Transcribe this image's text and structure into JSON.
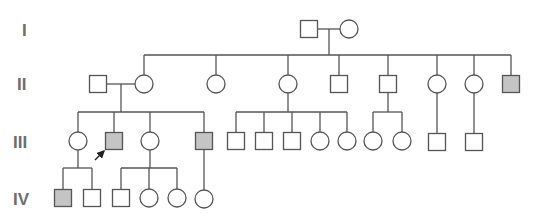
{
  "colors": {
    "line": "#555555",
    "unaffected_fill": "#ffffff",
    "affected_fill": "#c4c4c4",
    "label": "#6e6e6e"
  },
  "generations": [
    {
      "label": "I",
      "x": 22,
      "y": 36
    },
    {
      "label": "II",
      "x": 17,
      "y": 90
    },
    {
      "label": "III",
      "x": 13,
      "y": 148
    },
    {
      "label": "IV",
      "x": 13,
      "y": 205
    }
  ],
  "shape_size": 17,
  "individuals": [
    {
      "id": "I-1",
      "sex": "male",
      "affected": false,
      "x": 309,
      "y": 29
    },
    {
      "id": "I-2",
      "sex": "female",
      "affected": false,
      "x": 349,
      "y": 29
    },
    {
      "id": "II-spouse",
      "sex": "male",
      "affected": false,
      "x": 98,
      "y": 84
    },
    {
      "id": "II-1",
      "sex": "female",
      "affected": false,
      "x": 144,
      "y": 84
    },
    {
      "id": "II-2",
      "sex": "female",
      "affected": false,
      "x": 216,
      "y": 84
    },
    {
      "id": "II-3",
      "sex": "female",
      "affected": false,
      "x": 288,
      "y": 84
    },
    {
      "id": "II-4",
      "sex": "male",
      "affected": false,
      "x": 339,
      "y": 84
    },
    {
      "id": "II-5",
      "sex": "male",
      "affected": false,
      "x": 388,
      "y": 84
    },
    {
      "id": "II-6",
      "sex": "female",
      "affected": false,
      "x": 437,
      "y": 84
    },
    {
      "id": "II-7",
      "sex": "female",
      "affected": false,
      "x": 474,
      "y": 84
    },
    {
      "id": "II-8",
      "sex": "male",
      "affected": true,
      "x": 511,
      "y": 84
    },
    {
      "id": "III-1",
      "sex": "female",
      "affected": false,
      "x": 78,
      "y": 141
    },
    {
      "id": "III-2",
      "sex": "male",
      "affected": true,
      "proband": true,
      "x": 114,
      "y": 141
    },
    {
      "id": "III-3",
      "sex": "female",
      "affected": false,
      "x": 150,
      "y": 141
    },
    {
      "id": "III-4",
      "sex": "male",
      "affected": true,
      "x": 204,
      "y": 141
    },
    {
      "id": "III-5",
      "sex": "male",
      "affected": false,
      "x": 236,
      "y": 141
    },
    {
      "id": "III-6",
      "sex": "male",
      "affected": false,
      "x": 264,
      "y": 141
    },
    {
      "id": "III-7",
      "sex": "male",
      "affected": false,
      "x": 292,
      "y": 141
    },
    {
      "id": "III-8",
      "sex": "female",
      "affected": false,
      "x": 320,
      "y": 141
    },
    {
      "id": "III-9",
      "sex": "female",
      "affected": false,
      "x": 347,
      "y": 141
    },
    {
      "id": "III-10",
      "sex": "female",
      "affected": false,
      "x": 373,
      "y": 141
    },
    {
      "id": "III-11",
      "sex": "female",
      "affected": false,
      "x": 402,
      "y": 141
    },
    {
      "id": "III-12",
      "sex": "male",
      "affected": false,
      "x": 437,
      "y": 142
    },
    {
      "id": "III-13",
      "sex": "male",
      "affected": false,
      "x": 474,
      "y": 142
    },
    {
      "id": "IV-1",
      "sex": "male",
      "affected": true,
      "x": 63,
      "y": 198
    },
    {
      "id": "IV-2",
      "sex": "male",
      "affected": false,
      "x": 92,
      "y": 198
    },
    {
      "id": "IV-3",
      "sex": "male",
      "affected": false,
      "x": 121,
      "y": 198
    },
    {
      "id": "IV-4",
      "sex": "female",
      "affected": false,
      "x": 149,
      "y": 198
    },
    {
      "id": "IV-5",
      "sex": "female",
      "affected": false,
      "x": 177,
      "y": 198
    },
    {
      "id": "IV-6",
      "sex": "female",
      "affected": false,
      "x": 204,
      "y": 199
    }
  ],
  "lines": [
    [
      318,
      29,
      340,
      29
    ],
    [
      329,
      29,
      329,
      55
    ],
    [
      144,
      55,
      511,
      55
    ],
    [
      144,
      55,
      144,
      75
    ],
    [
      216,
      55,
      216,
      75
    ],
    [
      288,
      55,
      288,
      75
    ],
    [
      339,
      55,
      339,
      75
    ],
    [
      388,
      55,
      388,
      75
    ],
    [
      437,
      55,
      437,
      75
    ],
    [
      474,
      55,
      474,
      75
    ],
    [
      511,
      55,
      511,
      75
    ],
    [
      107,
      84,
      135,
      84
    ],
    [
      121,
      84,
      121,
      112
    ],
    [
      78,
      112,
      204,
      112
    ],
    [
      78,
      112,
      78,
      132
    ],
    [
      114,
      112,
      114,
      132
    ],
    [
      150,
      112,
      150,
      132
    ],
    [
      204,
      112,
      204,
      132
    ],
    [
      288,
      93,
      288,
      112
    ],
    [
      236,
      112,
      347,
      112
    ],
    [
      236,
      112,
      236,
      132
    ],
    [
      264,
      112,
      264,
      132
    ],
    [
      292,
      112,
      292,
      132
    ],
    [
      320,
      112,
      320,
      132
    ],
    [
      347,
      112,
      347,
      132
    ],
    [
      388,
      93,
      388,
      112
    ],
    [
      373,
      112,
      402,
      112
    ],
    [
      373,
      112,
      373,
      132
    ],
    [
      402,
      112,
      402,
      132
    ],
    [
      437,
      93,
      437,
      133
    ],
    [
      474,
      93,
      474,
      133
    ],
    [
      78,
      150,
      78,
      168
    ],
    [
      63,
      168,
      92,
      168
    ],
    [
      63,
      168,
      63,
      189
    ],
    [
      92,
      168,
      92,
      189
    ],
    [
      150,
      150,
      150,
      168
    ],
    [
      121,
      168,
      177,
      168
    ],
    [
      121,
      168,
      121,
      189
    ],
    [
      149,
      168,
      149,
      189
    ],
    [
      177,
      168,
      177,
      189
    ],
    [
      204,
      150,
      204,
      190
    ]
  ],
  "proband_arrow": {
    "x1": 95,
    "y1": 160,
    "x2": 104,
    "y2": 151,
    "points_to": "III-2"
  }
}
